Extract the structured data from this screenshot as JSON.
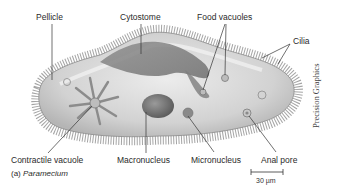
{
  "figure": {
    "caption_prefix": "(a)",
    "caption_name": "Paramecium",
    "credit": "Precision Graphics",
    "scale_bar": "30 µm"
  },
  "labels": {
    "pellicle": "Pellicle",
    "cytostome": "Cytostome",
    "food_vacuoles": "Food vacuoles",
    "cilia": "Cilia",
    "contractile_vacuole": "Contractile vacuole",
    "macronucleus": "Macronucleus",
    "micronucleus": "Micronucleus",
    "anal_pore": "Anal pore"
  },
  "colors": {
    "body_fill": "#d9d9d9",
    "body_dark": "#8a8a8a",
    "leader_line": "#333333",
    "background": "#ffffff"
  }
}
